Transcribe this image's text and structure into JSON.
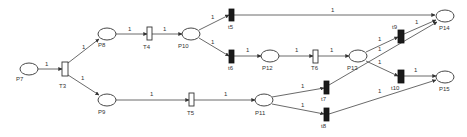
{
  "diagram": {
    "type": "petri-net",
    "places": [
      {
        "id": "P7",
        "label": "P7"
      },
      {
        "id": "P8",
        "label": "P8"
      },
      {
        "id": "P9",
        "label": "P9"
      },
      {
        "id": "P10",
        "label": "P10"
      },
      {
        "id": "P11",
        "label": "P11"
      },
      {
        "id": "P12",
        "label": "P12"
      },
      {
        "id": "P13",
        "label": "P13"
      },
      {
        "id": "P14",
        "label": "P14"
      },
      {
        "id": "P15",
        "label": "P15"
      }
    ],
    "transitions": [
      {
        "id": "T3",
        "label": "T3",
        "kind": "timed"
      },
      {
        "id": "T4",
        "label": "T4",
        "kind": "timed"
      },
      {
        "id": "T5",
        "label": "T5",
        "kind": "timed"
      },
      {
        "id": "T6",
        "label": "T6",
        "kind": "timed"
      },
      {
        "id": "t5",
        "label": "t5",
        "kind": "immediate"
      },
      {
        "id": "t6",
        "label": "t6",
        "kind": "immediate"
      },
      {
        "id": "t7",
        "label": "t7",
        "kind": "immediate"
      },
      {
        "id": "t8",
        "label": "t8",
        "kind": "immediate"
      },
      {
        "id": "t9",
        "label": "t9",
        "kind": "immediate"
      },
      {
        "id": "t10",
        "label": "t10",
        "kind": "immediate"
      }
    ],
    "arcs": [
      {
        "from": "P7",
        "to": "T3",
        "weight": "1"
      },
      {
        "from": "T3",
        "to": "P8",
        "weight": "1"
      },
      {
        "from": "T3",
        "to": "P9",
        "weight": "1"
      },
      {
        "from": "P8",
        "to": "T4",
        "weight": "1"
      },
      {
        "from": "T4",
        "to": "P10",
        "weight": "1"
      },
      {
        "from": "P10",
        "to": "t5",
        "weight": "1"
      },
      {
        "from": "P10",
        "to": "t6",
        "weight": "1"
      },
      {
        "from": "t5",
        "to": "P14",
        "weight": "1"
      },
      {
        "from": "t6",
        "to": "P12",
        "weight": "1"
      },
      {
        "from": "P12",
        "to": "T6",
        "weight": "1"
      },
      {
        "from": "T6",
        "to": "P13",
        "weight": "1"
      },
      {
        "from": "P13",
        "to": "t9",
        "weight": "1"
      },
      {
        "from": "P13",
        "to": "t10",
        "weight": "1"
      },
      {
        "from": "t9",
        "to": "P14",
        "weight": "1"
      },
      {
        "from": "t10",
        "to": "P15",
        "weight": "1"
      },
      {
        "from": "P9",
        "to": "T5",
        "weight": "1"
      },
      {
        "from": "T5",
        "to": "P11",
        "weight": "1"
      },
      {
        "from": "P11",
        "to": "t7",
        "weight": "1"
      },
      {
        "from": "P11",
        "to": "t8",
        "weight": "1"
      },
      {
        "from": "t7",
        "to": "P14",
        "weight": "1"
      },
      {
        "from": "t8",
        "to": "P15",
        "weight": "1"
      }
    ]
  }
}
